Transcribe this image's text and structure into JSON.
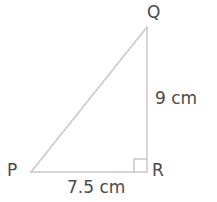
{
  "figure": {
    "kind": "right-triangle-geometry-diagram",
    "background_color": "#ffffff",
    "stroke_color": "#c8c8c8",
    "text_color": "#4a4a4a",
    "stroke_width": 1.5,
    "canvas": {
      "width": 217,
      "height": 202
    }
  },
  "vertices": {
    "Q": {
      "label": "Q",
      "x": 147,
      "y": 27
    },
    "P": {
      "label": "P",
      "x": 31,
      "y": 172
    },
    "R": {
      "label": "R",
      "x": 147,
      "y": 172
    }
  },
  "sides": {
    "QR": {
      "label": "9 cm",
      "value": 9,
      "unit": "cm"
    },
    "PR": {
      "label": "7.5 cm",
      "value": 7.5,
      "unit": "cm"
    },
    "PQ": {
      "label": "",
      "value": null,
      "unit": ""
    }
  },
  "right_angle": {
    "at_vertex": "R",
    "marker": "right-angle-square",
    "size": 13
  }
}
